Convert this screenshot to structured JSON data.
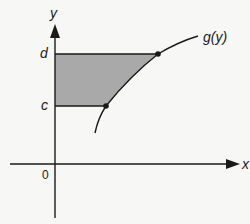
{
  "figure": {
    "axes": {
      "x_label": "x",
      "y_label": "y",
      "origin_label": "0"
    },
    "levels": {
      "lower_label": "c",
      "upper_label": "d"
    },
    "curve": {
      "label": "g(y)"
    },
    "region": {
      "description": "Shaded region bounded by the y-axis, the horizontal lines y = c and y = d, and the curve x = g(y)",
      "fill_color": "#a9a9a9"
    },
    "colors": {
      "background": "#f7f7f5",
      "line": "#1a1a1a",
      "shade": "#a9a9a9"
    }
  }
}
